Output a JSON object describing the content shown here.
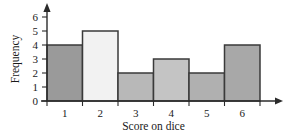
{
  "chart_data": {
    "type": "bar",
    "title": "",
    "subtitle": "",
    "xlabel": "Score on dice",
    "ylabel": "Frequency",
    "categories": [
      "1",
      "2",
      "3",
      "4",
      "5",
      "6"
    ],
    "values": [
      4,
      5,
      2,
      3,
      2,
      4
    ],
    "series": [
      {
        "name": "Frequency",
        "values": [
          4,
          5,
          2,
          3,
          2,
          4
        ]
      }
    ],
    "xlim": [
      0,
      6
    ],
    "ylim": [
      0,
      6
    ],
    "y_ticks": [
      "0",
      "1",
      "2",
      "3",
      "4",
      "5",
      "6"
    ],
    "y_tick_values": [
      0,
      1,
      2,
      3,
      4,
      5,
      6
    ],
    "x_tick_labels": [
      "1",
      "2",
      "3",
      "4",
      "5",
      "6"
    ],
    "grid": false,
    "legend": false,
    "legend_position": "none",
    "bar_colors": [
      "#9a9a9a",
      "#f2f2f2",
      "#b8b8b8",
      "#c4c4c4",
      "#b0b0b0",
      "#a8a8a8"
    ],
    "bar_edge_color": "#3a3a3a",
    "axis_color": "#2b2b2b",
    "background_color": "#ffffff",
    "annotations": [],
    "bars": [
      {
        "category": "1",
        "value": 4,
        "fill": "#9a9a9a"
      },
      {
        "category": "2",
        "value": 5,
        "fill": "#f2f2f2"
      },
      {
        "category": "3",
        "value": 2,
        "fill": "#b8b8b8"
      },
      {
        "category": "4",
        "value": 3,
        "fill": "#c4c4c4"
      },
      {
        "category": "5",
        "value": 2,
        "fill": "#b0b0b0"
      },
      {
        "category": "6",
        "value": 4,
        "fill": "#a8a8a8"
      }
    ]
  }
}
